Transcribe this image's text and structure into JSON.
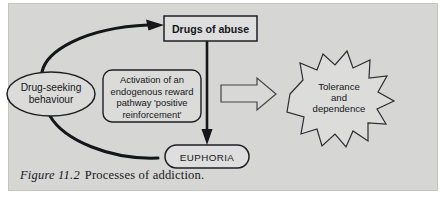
{
  "figure": {
    "caption_label": "Figure 11.2",
    "caption_text": "Processes of addiction.",
    "panel_background": "#d6d6d4",
    "ink_color": "#1d1f23"
  },
  "nodes": {
    "drug_seeking": {
      "label_line1": "Drug-seeking",
      "label_line2": "behaviour",
      "shape": "ellipse"
    },
    "drugs_of_abuse": {
      "label": "Drugs of abuse",
      "shape": "rectangle"
    },
    "activation": {
      "label_line1": "Activation of an",
      "label_line2": "endogenous reward",
      "label_line3": "pathway 'positive",
      "label_line4": "reinforcement'",
      "shape": "rounded-rectangle"
    },
    "euphoria": {
      "label": "EUPHORIA",
      "shape": "stadium"
    },
    "tolerance": {
      "label_line1": "Tolerance",
      "label_line2": "and",
      "label_line3": "dependence",
      "shape": "starburst"
    }
  },
  "connectors": {
    "seeking_to_drugs": "curved-arrow-up-right",
    "drugs_to_euphoria": "straight-arrow-down",
    "euphoria_to_seeking": "curved-arrow-down-left",
    "to_tolerance": "block-arrow-right"
  }
}
